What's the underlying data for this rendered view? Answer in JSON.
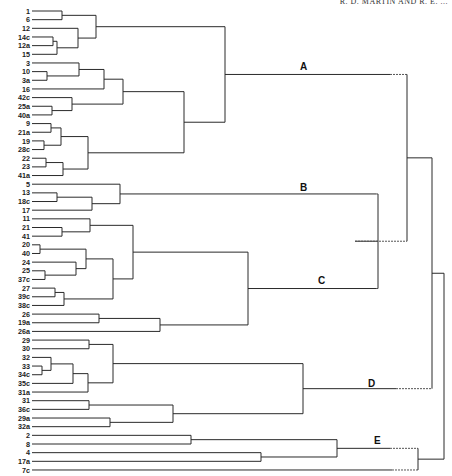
{
  "header": {
    "running_head": "R. D. MARTIN AND R. E. ..."
  },
  "diagram": {
    "type": "dendrogram",
    "orientation": "left-to-right",
    "leaf_x": 32,
    "leaf_y0": 11,
    "leaf_dy": 8.66,
    "leaves": [
      "1",
      "6",
      "12",
      "14c",
      "12a",
      "15",
      "3",
      "10",
      "3a",
      "16",
      "42c",
      "25a",
      "40a",
      "9",
      "21a",
      "19",
      "28c",
      "22",
      "23",
      "41a",
      "5",
      "13",
      "18c",
      "17",
      "11",
      "21",
      "41",
      "20",
      "40",
      "24",
      "25",
      "37c",
      "27",
      "39c",
      "38c",
      "26",
      "19a",
      "26a",
      "29",
      "30",
      "32",
      "33",
      "34c",
      "35c",
      "31a",
      "31",
      "36c",
      "29a",
      "32a",
      "2",
      "8",
      "4",
      "17a",
      "7c"
    ],
    "nodes": [
      {
        "id": "n1_6",
        "children": [
          "1",
          "6"
        ],
        "x": 62
      },
      {
        "id": "n14c_12a",
        "children": [
          "14c",
          "12a"
        ],
        "x": 53
      },
      {
        "id": "n_15",
        "children": [
          "n14c_12a",
          "15"
        ],
        "x": 57
      },
      {
        "id": "n12",
        "children": [
          "12",
          "n_15"
        ],
        "x": 78
      },
      {
        "id": "nA1",
        "children": [
          "n1_6",
          "n12"
        ],
        "x": 96
      },
      {
        "id": "n10_3a",
        "children": [
          "10",
          "3a"
        ],
        "x": 47
      },
      {
        "id": "n3",
        "children": [
          "3",
          "n10_3a"
        ],
        "x": 79
      },
      {
        "id": "n16",
        "children": [
          "n3",
          "16"
        ],
        "x": 104
      },
      {
        "id": "n25a_40a",
        "children": [
          "25a",
          "40a"
        ],
        "x": 52
      },
      {
        "id": "n42c",
        "children": [
          "42c",
          "n25a_40a"
        ],
        "x": 72
      },
      {
        "id": "nA2a",
        "children": [
          "n16",
          "n42c"
        ],
        "x": 123
      },
      {
        "id": "n9_21a",
        "children": [
          "9",
          "21a"
        ],
        "x": 51
      },
      {
        "id": "n19_28c",
        "children": [
          "19",
          "28c"
        ],
        "x": 44
      },
      {
        "id": "n9g",
        "children": [
          "n9_21a",
          "n19_28c"
        ],
        "x": 61
      },
      {
        "id": "n22_23",
        "children": [
          "22",
          "23"
        ],
        "x": 46
      },
      {
        "id": "n41a",
        "children": [
          "n22_23",
          "41a"
        ],
        "x": 63
      },
      {
        "id": "nA2b",
        "children": [
          "n9g",
          "n41a"
        ],
        "x": 88
      },
      {
        "id": "nA2",
        "children": [
          "nA2a",
          "nA2b"
        ],
        "x": 184
      },
      {
        "id": "A",
        "children": [
          "nA1",
          "nA2"
        ],
        "x": 225,
        "label": "A"
      },
      {
        "id": "n13_18c",
        "children": [
          "13",
          "18c"
        ],
        "x": 57
      },
      {
        "id": "n17",
        "children": [
          "n13_18c",
          "17"
        ],
        "x": 92
      },
      {
        "id": "B",
        "children": [
          "5",
          "n17"
        ],
        "x": 120,
        "label": "B"
      },
      {
        "id": "n21_41",
        "children": [
          "21",
          "41"
        ],
        "x": 62
      },
      {
        "id": "n11",
        "children": [
          "11",
          "n21_41"
        ],
        "x": 90
      },
      {
        "id": "n20_40",
        "children": [
          "20",
          "40"
        ],
        "x": 40
      },
      {
        "id": "n25_37c",
        "children": [
          "25",
          "37c"
        ],
        "x": 45
      },
      {
        "id": "n24",
        "children": [
          "24",
          "n25_37c"
        ],
        "x": 76
      },
      {
        "id": "n20g",
        "children": [
          "n20_40",
          "n24"
        ],
        "x": 86
      },
      {
        "id": "n27_39c",
        "children": [
          "27",
          "39c"
        ],
        "x": 55
      },
      {
        "id": "n38c",
        "children": [
          "n27_39c",
          "38c"
        ],
        "x": 64
      },
      {
        "id": "nC2",
        "children": [
          "n20g",
          "n38c"
        ],
        "x": 113
      },
      {
        "id": "nC1",
        "children": [
          "n11",
          "nC2"
        ],
        "x": 133
      },
      {
        "id": "n26_19a",
        "children": [
          "26",
          "19a"
        ],
        "x": 99
      },
      {
        "id": "n26a",
        "children": [
          "n26_19a",
          "26a"
        ],
        "x": 160
      },
      {
        "id": "C",
        "children": [
          "nC1",
          "n26a"
        ],
        "x": 248,
        "label": "C"
      },
      {
        "id": "BC",
        "children": [
          "B",
          "C"
        ],
        "x": 378,
        "dashed": true
      },
      {
        "id": "AB",
        "children": [
          "A",
          "BC"
        ],
        "x": 407,
        "dashed": true
      },
      {
        "id": "n29_30",
        "children": [
          "29",
          "30"
        ],
        "x": 89
      },
      {
        "id": "n33_34c",
        "children": [
          "33",
          "34c"
        ],
        "x": 42
      },
      {
        "id": "n32",
        "children": [
          "32",
          "n33_34c"
        ],
        "x": 51
      },
      {
        "id": "n35c",
        "children": [
          "n32",
          "35c"
        ],
        "x": 73
      },
      {
        "id": "n31a",
        "children": [
          "n35c",
          "31a"
        ],
        "x": 88
      },
      {
        "id": "nD1",
        "children": [
          "n29_30",
          "n31a"
        ],
        "x": 113
      },
      {
        "id": "n31_36c",
        "children": [
          "31",
          "36c"
        ],
        "x": 89
      },
      {
        "id": "n29a_32a",
        "children": [
          "29a",
          "32a"
        ],
        "x": 110
      },
      {
        "id": "nD2",
        "children": [
          "n31_36c",
          "n29a_32a"
        ],
        "x": 173
      },
      {
        "id": "D",
        "children": [
          "nD1",
          "nD2"
        ],
        "x": 303,
        "label": "D"
      },
      {
        "id": "ABD",
        "children": [
          "AB",
          "D"
        ],
        "x": 432,
        "dashed": true
      },
      {
        "id": "n2_8",
        "children": [
          "2",
          "8"
        ],
        "x": 191
      },
      {
        "id": "n4_17a",
        "children": [
          "4",
          "17a"
        ],
        "x": 261
      },
      {
        "id": "E",
        "children": [
          "n2_8",
          "n4_17a"
        ],
        "x": 337,
        "label": "E"
      },
      {
        "id": "E7c",
        "children": [
          "E",
          "7c"
        ],
        "x": 418,
        "dashed": true
      },
      {
        "id": "root",
        "children": [
          "ABD",
          "E7c"
        ],
        "x": 444,
        "dashed": true
      }
    ],
    "solid_cutoff": {
      "A": 390,
      "BC": 355,
      "B": 376,
      "C": 376,
      "D": 396,
      "E": 390,
      "7c": 392
    },
    "clusters": [
      {
        "label": "A",
        "x": 300,
        "y": 70
      },
      {
        "label": "B",
        "x": 300,
        "y": 191
      },
      {
        "label": "C",
        "x": 318,
        "y": 284
      },
      {
        "label": "D",
        "x": 368,
        "y": 387
      },
      {
        "label": "E",
        "x": 374,
        "y": 444
      }
    ]
  }
}
